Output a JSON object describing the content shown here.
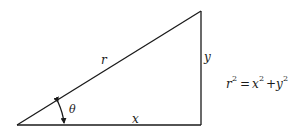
{
  "diagram": {
    "type": "right-triangle",
    "vertices": {
      "origin": [
        17,
        125
      ],
      "right_angle": [
        201,
        125
      ],
      "top": [
        201,
        11
      ]
    },
    "stroke_color": "#1a1a1a",
    "labels": {
      "hypotenuse": "r",
      "vertical_leg": "y",
      "horizontal_leg": "x",
      "angle": "θ"
    },
    "equation": {
      "lhs_base": "r",
      "lhs_exp": "2",
      "equals": "=",
      "term1_base": "x",
      "term1_exp": "2",
      "plus": "+",
      "term2_base": "y",
      "term2_exp": "2"
    }
  }
}
